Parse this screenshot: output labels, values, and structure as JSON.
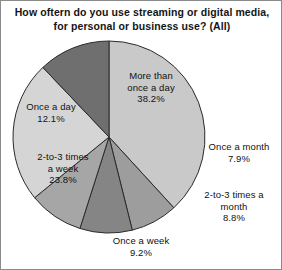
{
  "chart_data": {
    "type": "pie",
    "title": "How oftern do you use streaming or digital media, for personal or business use? (All)",
    "xlabel": "",
    "ylabel": "",
    "legend": "none",
    "grid": false,
    "start_angle_deg": 0,
    "direction": "clockwise",
    "categories": [
      "More than once a day",
      "Once a month",
      "2-to-3 times a month",
      "Once a week",
      "2-to-3 times a week",
      "Once a day"
    ],
    "values": [
      38.2,
      7.9,
      8.8,
      9.2,
      23.8,
      12.1
    ],
    "value_suffix": "%",
    "slices": [
      {
        "name": "More than once a day",
        "value": 38.2,
        "value_text": "38.2%",
        "label_text": "More than\nonce a day\n38.2%",
        "color": "#c9c9c9",
        "start_deg": 0.0,
        "end_deg": 137.52
      },
      {
        "name": "Once a month",
        "value": 7.9,
        "value_text": "7.9%",
        "label_text": "Once a month\n7.9%",
        "color": "#9d9d9d",
        "start_deg": 137.52,
        "end_deg": 165.96
      },
      {
        "name": "2-to-3 times a month",
        "value": 8.8,
        "value_text": "8.8%",
        "label_text": "2-to-3 times a\nmonth\n8.8%",
        "color": "#858585",
        "start_deg": 165.96,
        "end_deg": 197.64
      },
      {
        "name": "Once a week",
        "value": 9.2,
        "value_text": "9.2%",
        "label_text": "Once a week\n9.2%",
        "color": "#a6a6a6",
        "start_deg": 197.64,
        "end_deg": 230.76
      },
      {
        "name": "2-to-3 times a week",
        "value": 23.8,
        "value_text": "23.8%",
        "label_text": "2-to-3 times\na week\n23.8%",
        "color": "#d5d5d5",
        "start_deg": 230.76,
        "end_deg": 316.44
      },
      {
        "name": "Once a day",
        "value": 12.1,
        "value_text": "12.1%",
        "label_text": "Once a day\n12.1%",
        "color": "#6f6f6f",
        "start_deg": 316.44,
        "end_deg": 360.0
      }
    ],
    "geometry": {
      "center_x": 108,
      "center_y": 136,
      "radius": 96
    },
    "style": {
      "background": "#ffffff",
      "border_color": "#8a8a8a",
      "slice_outline": "#2b2b2b",
      "text_color": "#111111"
    }
  }
}
